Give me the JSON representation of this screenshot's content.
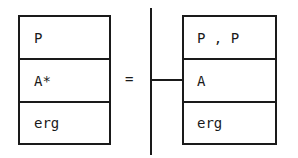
{
  "left_box": {
    "rows": [
      "P",
      "A*",
      "erg"
    ]
  },
  "operator": "=",
  "right_box": {
    "rows": [
      "P , P",
      "A",
      "erg"
    ]
  }
}
